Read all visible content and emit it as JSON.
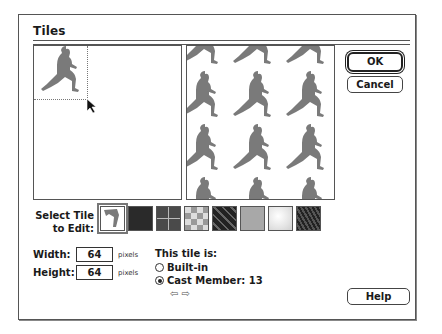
{
  "dialog": {
    "title": "Tiles",
    "buttons": {
      "ok": "OK",
      "cancel": "Cancel",
      "help": "Help"
    }
  },
  "select_tile": {
    "label_line1": "Select Tile",
    "label_line2": "to Edit:",
    "tiles": [
      {
        "name": "cast-member-runner",
        "selected": true
      },
      {
        "name": "dark-solid"
      },
      {
        "name": "grid-squares"
      },
      {
        "name": "checker-light"
      },
      {
        "name": "diagonal-stripes"
      },
      {
        "name": "gray-texture"
      },
      {
        "name": "white-marble"
      },
      {
        "name": "dark-weave"
      }
    ]
  },
  "dimensions": {
    "width_label": "Width:",
    "width_value": "64",
    "height_label": "Height:",
    "height_value": "64",
    "unit": "pixels"
  },
  "tile_source": {
    "label": "This tile is:",
    "options": [
      {
        "label": "Built-in",
        "selected": false
      },
      {
        "label": "Cast Member: 13",
        "selected": true
      }
    ],
    "prev_arrow": "⇦",
    "next_arrow": "⇨"
  },
  "colors": {
    "figure": "#7a7a7a",
    "border": "#555555"
  }
}
